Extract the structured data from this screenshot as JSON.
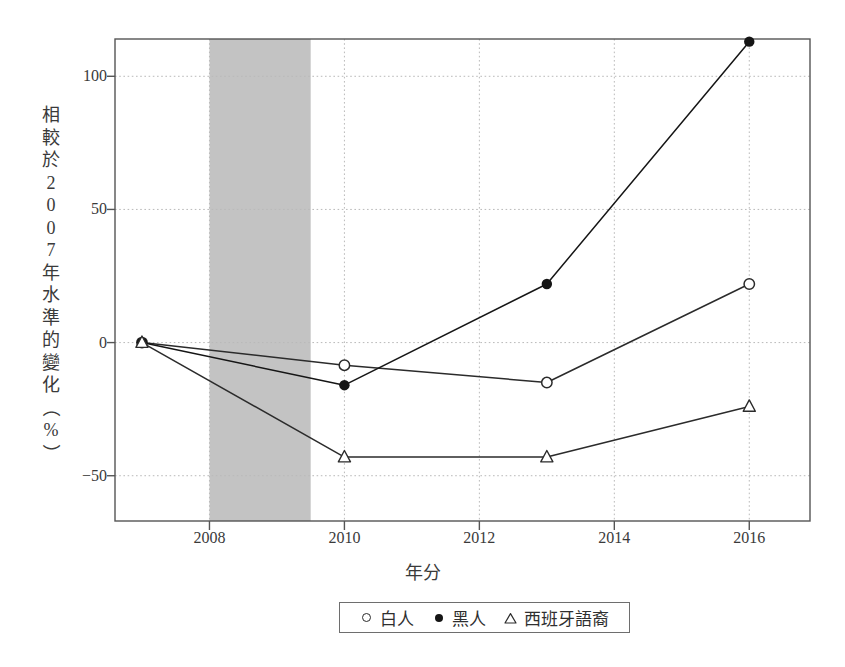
{
  "chart_data": {
    "type": "line",
    "title": "",
    "xlabel": "年分",
    "ylabel": "相較於2007年水準的變化（%）",
    "ylabel_chars": [
      "相",
      "較",
      "於",
      "2",
      "0",
      "0",
      "7",
      "年",
      "水",
      "準",
      "的",
      "變",
      "化",
      "（",
      "%",
      "）"
    ],
    "xlim": [
      2006.6,
      2016.9
    ],
    "ylim": [
      -67,
      114
    ],
    "x_ticks": [
      2008,
      2010,
      2012,
      2014,
      2016
    ],
    "x_tick_labels": [
      "2008",
      "2010",
      "2012",
      "2014",
      "2016"
    ],
    "y_ticks": [
      -50,
      0,
      50,
      100
    ],
    "y_tick_labels": [
      "-50",
      "0",
      "50",
      "100"
    ],
    "grid": true,
    "legend_position": "below-axes",
    "shaded_region": {
      "label": "recession-band",
      "x_start": 2008.0,
      "x_end": 2009.5,
      "color": "#c3c3c3"
    },
    "x": [
      2007,
      2010,
      2013,
      2016
    ],
    "series": [
      {
        "name": "白人",
        "marker": "open-circle",
        "color": "#2b2b2b",
        "values": [
          0,
          -8.5,
          -15,
          22
        ]
      },
      {
        "name": "黑人",
        "marker": "filled-circle",
        "color": "#151515",
        "values": [
          0,
          -16,
          22,
          113
        ]
      },
      {
        "name": "西班牙語裔",
        "marker": "open-triangle",
        "color": "#2b2b2b",
        "values": [
          0,
          -43,
          -43,
          -24
        ]
      }
    ]
  },
  "legend": {
    "entries": [
      {
        "marker": "open-circle",
        "label": "白人"
      },
      {
        "marker": "filled-circle",
        "label": "黑人"
      },
      {
        "marker": "open-triangle",
        "label": "西班牙語裔"
      }
    ]
  },
  "colors": {
    "axis": "#555555",
    "grid": "#b9b9b9",
    "shade": "#c3c3c3",
    "text": "#3a3a3a",
    "background": "#ffffff"
  }
}
